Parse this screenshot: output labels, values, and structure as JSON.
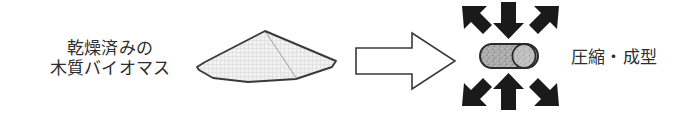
{
  "figure": {
    "type": "process-flow-diagram",
    "background_color": "#ffffff",
    "outline_color": "#2e2e2e",
    "text_color": "#2e2e2e",
    "arrow_fill_color": "#1a1a1a"
  },
  "feedstock": {
    "label_line1": "乾燥済みの",
    "label_line2": "木質バイオマス",
    "pile_icon_name": "biomass-pile-icon",
    "pile_fill_color": "#ececec"
  },
  "flow": {
    "arrow_icon_name": "right-block-arrow-icon",
    "arrow_fill_color": "#ffffff",
    "direction": "right"
  },
  "product": {
    "label": "圧縮・成型",
    "pellet_icon_name": "pellet-cylinder-icon",
    "pellet_fill_color": "#a9a9a9",
    "compression_arrows_count": 6,
    "compression_arrow_directions": [
      "down-right",
      "down",
      "down-left",
      "up-right",
      "up",
      "up-left"
    ]
  }
}
